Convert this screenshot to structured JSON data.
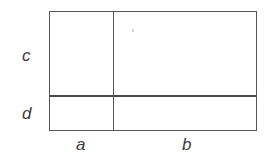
{
  "figure": {
    "name": "partitioned-rectangle-area-model",
    "background_color": "#ffffff",
    "line_color": "#575757",
    "divider_color": "#4b4b4b",
    "label_color": "#3d3d3d",
    "rectangle": {
      "left": 49,
      "top": 11,
      "width": 208,
      "height": 120
    },
    "dividers": {
      "vertical_x": 113,
      "horizontal_y": 95
    },
    "labels": {
      "left_upper": "c",
      "left_lower": "d",
      "bottom_left": "a",
      "bottom_right": "b"
    },
    "artifact": {
      "name": "scan-speck",
      "x": 132,
      "y": 29
    }
  }
}
